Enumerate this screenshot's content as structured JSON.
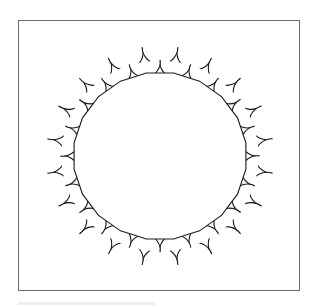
{
  "figure": {
    "frame": {
      "x": 18,
      "y": 20,
      "width": 282,
      "height": 271,
      "stroke": "#6b6b6b"
    },
    "center": {
      "x": 160,
      "y": 156
    },
    "scale_x": 1.035,
    "polygon_sides": 20,
    "inner_apothem": 83,
    "ring_count": 3,
    "stroke_color": "#1a1a1a",
    "stroke_width": 1.1,
    "fill": "#ffffff"
  },
  "caption_bar": {
    "color": "#ececec"
  }
}
